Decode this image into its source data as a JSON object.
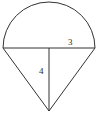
{
  "figure": {
    "background_color": "#ffffff",
    "stroke_color": "#333333",
    "stroke_width": 1,
    "labels": {
      "top_side": "3",
      "height": "4"
    },
    "shapes": {
      "semicircle": {
        "name": "semicircle-arc",
        "center_x": 49,
        "center_y": 48,
        "radius": 46,
        "orientation": "upward"
      },
      "diameter": {
        "name": "diameter-line",
        "x1": 3,
        "y1": 48,
        "x2": 95,
        "y2": 48
      },
      "triangle": {
        "name": "downward-triangle",
        "left_vertex_x": 3,
        "left_vertex_y": 48,
        "right_vertex_x": 95,
        "right_vertex_y": 48,
        "apex_x": 49,
        "apex_y": 111
      },
      "height_line": {
        "name": "triangle-height-line",
        "x1": 49,
        "y1": 48,
        "x2": 49,
        "y2": 111
      }
    }
  }
}
